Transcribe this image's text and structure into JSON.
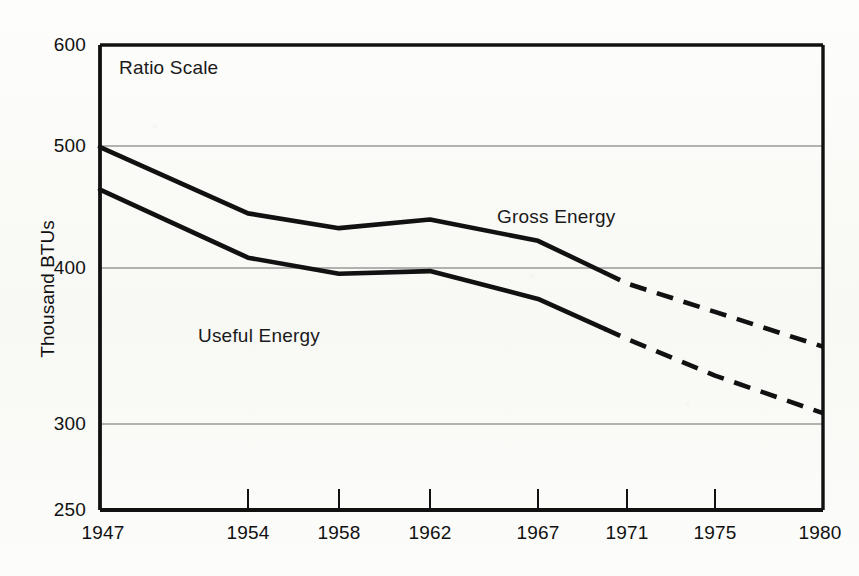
{
  "chart_data": {
    "type": "line",
    "title": "",
    "subtitle": "",
    "xlabel": "",
    "ylabel": "Thousand BTUs",
    "scale_note": "Ratio Scale",
    "y_axis_type": "log",
    "xlim": [
      1947,
      1980
    ],
    "ylim": [
      250,
      600
    ],
    "yticks": [
      250,
      300,
      400,
      500,
      600
    ],
    "ytick_labels": [
      "250",
      "300",
      "400",
      "500",
      "600"
    ],
    "gridlines": [
      300,
      400,
      500
    ],
    "grid": true,
    "legend_position": "inline-annotation",
    "xticks": [
      1947,
      1954,
      1958,
      1962,
      1967,
      1971,
      1975,
      1980
    ],
    "xtick_labels": [
      "1947",
      "1954",
      "1958",
      "1962",
      "1967",
      "1971",
      "1975",
      "1980"
    ],
    "series": [
      {
        "name": "Gross Energy",
        "label": "Gross Energy",
        "color": "#111111",
        "x": [
          1947,
          1954,
          1958,
          1962,
          1967,
          1971,
          1975,
          1980
        ],
        "values": [
          495,
          437,
          425,
          432,
          415,
          383,
          363,
          340
        ],
        "solid_through": 1971,
        "projected_from": 1971,
        "projected_style": "dashed"
      },
      {
        "name": "Useful Energy",
        "label": "Useful Energy",
        "color": "#111111",
        "x": [
          1947,
          1954,
          1958,
          1962,
          1967,
          1971,
          1975,
          1980
        ],
        "values": [
          457,
          402,
          390,
          392,
          372,
          345,
          322,
          300
        ],
        "solid_through": 1971,
        "projected_from": 1971,
        "projected_style": "dashed"
      }
    ],
    "annotations": [
      {
        "text": "Ratio Scale",
        "x": 1948,
        "y": 575
      },
      {
        "text": "Gross Energy",
        "x": 1965,
        "y": 458
      },
      {
        "text": "Useful Energy",
        "x": 1953,
        "y": 368
      }
    ]
  },
  "axis": {
    "y_title": "Thousand BTUs",
    "y_labels": [
      "600",
      "500",
      "400",
      "300",
      "250"
    ],
    "x_labels": [
      "1947",
      "1954",
      "1958",
      "1962",
      "1967",
      "1971",
      "1975",
      "1980"
    ]
  },
  "labels": {
    "ratio_scale": "Ratio Scale",
    "gross_energy": "Gross Energy",
    "useful_energy": "Useful Energy"
  },
  "colors": {
    "line": "#111111",
    "grid": "#6a6a6a",
    "frame": "#111111",
    "paper": "#fbfbf9"
  }
}
